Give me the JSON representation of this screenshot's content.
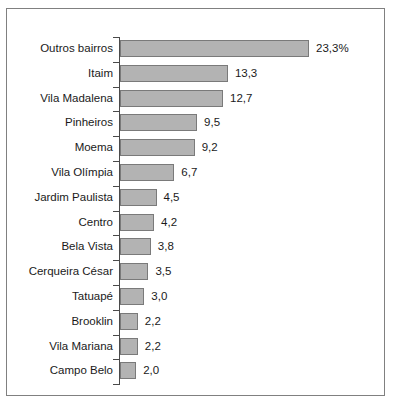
{
  "chart_data": {
    "type": "bar",
    "orientation": "horizontal",
    "title": "",
    "xlabel": "",
    "ylabel": "",
    "grid": false,
    "legend": null,
    "unit": "%",
    "xlim": [
      0,
      23.3
    ],
    "categories": [
      "Outros bairros",
      "Itaim",
      "Vila Madalena",
      "Pinheiros",
      "Moema",
      "Vila Olímpia",
      "Jardim Paulista",
      "Centro",
      "Bela Vista",
      "Cerqueira César",
      "Tatuapé",
      "Brooklin",
      "Vila Mariana",
      "Campo Belo"
    ],
    "values": [
      23.3,
      13.3,
      12.7,
      9.5,
      9.2,
      6.7,
      4.5,
      4.2,
      3.8,
      3.5,
      3.0,
      2.2,
      2.2,
      2.0
    ],
    "value_labels": [
      "23,3%",
      "13,3",
      "12,7",
      "9,5",
      "9,2",
      "6,7",
      "4,5",
      "4,2",
      "3,8",
      "3,5",
      "3,0",
      "2,2",
      "2,2",
      "2,0"
    ],
    "bar_color": "#b3b3b3",
    "bar_border_color": "#7a7a7a",
    "axis_color": "#4a4a4a",
    "frame_color": "#808080",
    "text_color": "#1a1a1a"
  }
}
